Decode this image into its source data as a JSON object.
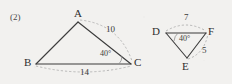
{
  "problem": {
    "number_label": "(2)"
  },
  "colors": {
    "background": "#f2f1ef",
    "solid_stroke": "#3b3b3b",
    "dashed_stroke": "#a9a9a9",
    "text": "#2e2e2e"
  },
  "figures": [
    {
      "id": "triangle-abc",
      "vertices": [
        {
          "name": "A",
          "label": "A",
          "x": 78,
          "y": 22,
          "label_x": 74,
          "label_y": 8
        },
        {
          "name": "B",
          "label": "B",
          "x": 36,
          "y": 64,
          "label_x": 24,
          "label_y": 57
        },
        {
          "name": "C",
          "label": "C",
          "x": 131,
          "y": 64,
          "label_x": 134,
          "label_y": 57
        }
      ],
      "side_measures": [
        {
          "name": "side-ac",
          "value": "10",
          "x": 106,
          "y": 25
        },
        {
          "name": "side-bc",
          "value": "14",
          "x": 80,
          "y": 68
        }
      ],
      "angle_measures": [
        {
          "name": "angle-c",
          "value": "40°",
          "x": 100,
          "y": 50
        }
      ]
    },
    {
      "id": "triangle-def",
      "vertices": [
        {
          "name": "D",
          "label": "D",
          "x": 166,
          "y": 33,
          "label_x": 152,
          "label_y": 26
        },
        {
          "name": "F",
          "label": "F",
          "x": 206,
          "y": 33,
          "label_x": 208,
          "label_y": 26
        },
        {
          "name": "E",
          "label": "E",
          "x": 187,
          "y": 58,
          "label_x": 182,
          "label_y": 61
        }
      ],
      "side_measures": [
        {
          "name": "side-df",
          "value": "7",
          "x": 184,
          "y": 14
        },
        {
          "name": "side-ef",
          "value": "5",
          "x": 202,
          "y": 47
        }
      ],
      "angle_measures": [
        {
          "name": "angle-d",
          "value": "40°",
          "x": 179,
          "y": 35
        }
      ]
    }
  ]
}
